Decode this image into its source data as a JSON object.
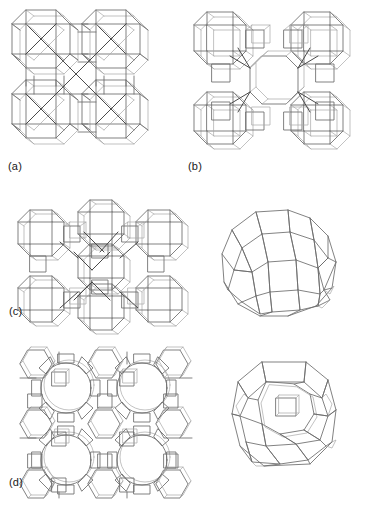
{
  "figure": {
    "kind": "scientific-line-figure",
    "background_color": "#ffffff",
    "line_color": "#6b6b6b",
    "line_color_front": "#4a4a4a",
    "line_color_back": "#a8a8a8",
    "label_color": "#1a1a1a",
    "width_px": 365,
    "height_px": 514
  },
  "panels": [
    {
      "id": "a",
      "label": "(a)",
      "subject": "framework-structure-a",
      "arrangement": "2x2 array of linked cages",
      "cage_columns": 2,
      "cage_rows": 2,
      "central_pore": "none"
    },
    {
      "id": "b",
      "label": "(b)",
      "subject": "framework-structure-b",
      "arrangement": "2x2 array of cages around one open central channel",
      "cage_columns": 2,
      "cage_rows": 2,
      "central_pore": "single large octagonal opening"
    },
    {
      "id": "c",
      "label": "(c)",
      "subject": "framework-structure-c",
      "arrangement": "cage network with bridging units",
      "cage_columns": 3,
      "cage_rows": 2,
      "central_pore": "central cage opening"
    },
    {
      "id": "d",
      "label": "(d)",
      "subject": "framework-structure-d",
      "arrangement": "2x2 array of large circular ring channels",
      "cage_columns": 2,
      "cage_rows": 2,
      "central_pore": "four large circular 12-ring pores"
    }
  ],
  "cages": [
    {
      "id": "cage-c",
      "belongs_to_panel": "c",
      "subject": "isolated-cage-polyhedron",
      "orientation": "tilted three-quarter view",
      "face_types": [
        "square",
        "hexagon",
        "octagon"
      ]
    },
    {
      "id": "cage-d",
      "belongs_to_panel": "d",
      "subject": "isolated-cage-polyhedron",
      "orientation": "upright front view",
      "face_types": [
        "square",
        "hexagon",
        "twelve-ring"
      ]
    }
  ]
}
